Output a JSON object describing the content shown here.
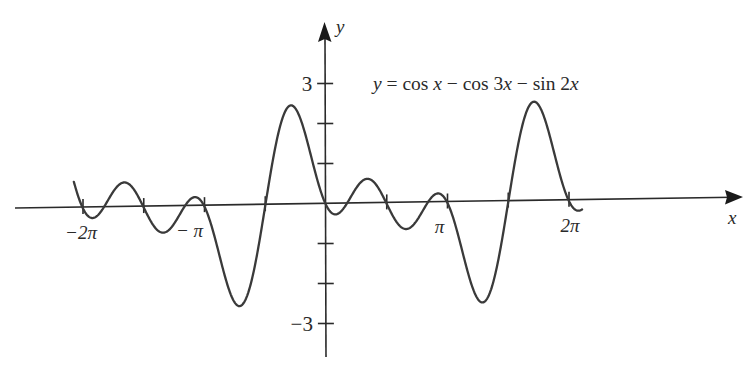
{
  "chart_data": {
    "type": "line",
    "title": "",
    "equation_label": "y = cos x − cos 3x − sin 2x",
    "equation_parts": {
      "lhs": "y",
      "eq": " = ",
      "t1": "cos ",
      "t1v": "x",
      "m1": " − ",
      "t2": "cos 3",
      "t2v": "x",
      "m2": " − ",
      "t3": "sin 2",
      "t3v": "x"
    },
    "function": "cos(x) - cos(3x) - sin(2x)",
    "xlabel": "x",
    "ylabel": "y",
    "x_domain": [
      -6.52,
      6.62
    ],
    "xlim": [
      -8.0,
      10.8
    ],
    "ylim": [
      -3.8,
      4.5
    ],
    "x_ticks": [
      {
        "value": -6.2832,
        "label": "−2π"
      },
      {
        "value": -4.7124,
        "label": ""
      },
      {
        "value": -3.1416,
        "label": "− π"
      },
      {
        "value": -1.5708,
        "label": ""
      },
      {
        "value": 1.5708,
        "label": ""
      },
      {
        "value": 3.1416,
        "label": "π"
      },
      {
        "value": 4.7124,
        "label": ""
      },
      {
        "value": 6.2832,
        "label": "2π"
      }
    ],
    "y_ticks": [
      {
        "value": 3,
        "label": "3"
      },
      {
        "value": 2,
        "label": ""
      },
      {
        "value": 1,
        "label": ""
      },
      {
        "value": -1,
        "label": ""
      },
      {
        "value": -2,
        "label": ""
      },
      {
        "value": -3,
        "label": "−3"
      }
    ],
    "key_points": [
      {
        "x": -6.52,
        "y": 0.77,
        "note": "left end"
      },
      {
        "x": -6.0,
        "y": -0.45,
        "note": "local min"
      },
      {
        "x": -5.5,
        "y": 0.55,
        "note": "local max"
      },
      {
        "x": -4.25,
        "y": -0.6,
        "note": "local min"
      },
      {
        "x": -3.5,
        "y": 0.28,
        "note": "local max"
      },
      {
        "x": -2.19,
        "y": -2.49,
        "note": "global min"
      },
      {
        "x": -0.9,
        "y": 2.49,
        "note": "global max"
      },
      {
        "x": 0.25,
        "y": -0.33,
        "note": "local min"
      },
      {
        "x": 0.75,
        "y": 0.6,
        "note": "local max"
      },
      {
        "x": 2.0,
        "y": -0.48,
        "note": "local min"
      },
      {
        "x": 2.8,
        "y": 0.23,
        "note": "local max"
      },
      {
        "x": 4.1,
        "y": -2.49,
        "note": "global min"
      },
      {
        "x": 5.39,
        "y": 2.49,
        "note": "global max"
      },
      {
        "x": 6.53,
        "y": -0.33,
        "note": "local min"
      },
      {
        "x": 6.62,
        "y": 0.77,
        "note": "right end"
      }
    ],
    "grid": false,
    "legend": null,
    "colors": {
      "curve": "#3a3a3a",
      "axes": "#2a2a2a",
      "text": "#2a2a2a",
      "background": "#ffffff"
    }
  }
}
